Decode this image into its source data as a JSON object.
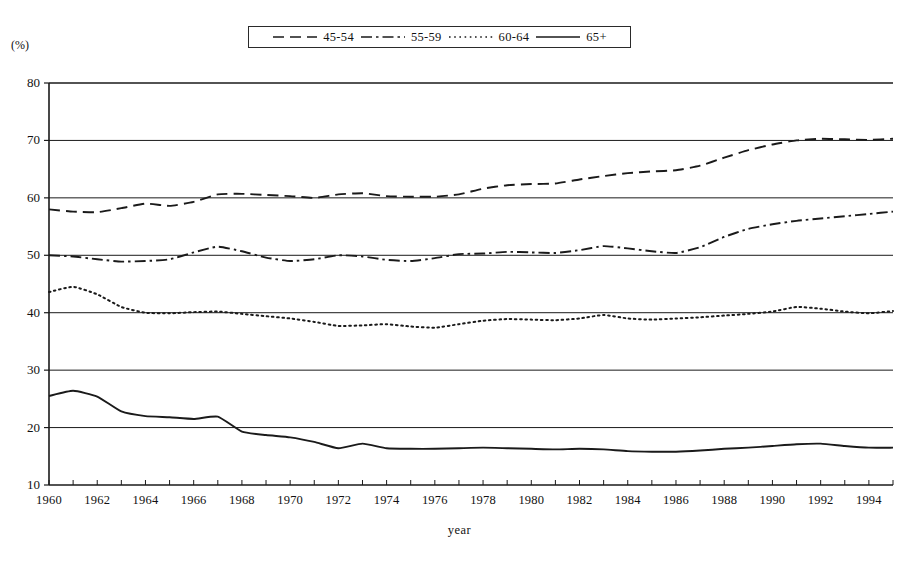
{
  "chart_data": {
    "type": "line",
    "title": "",
    "xlabel": "year",
    "ylabel": "(%)",
    "ylim": [
      10,
      80
    ],
    "xlim": [
      1960,
      1995
    ],
    "yticks": [
      80,
      70,
      60,
      50,
      40,
      30,
      20,
      10
    ],
    "xticks": [
      1960,
      1962,
      1964,
      1966,
      1968,
      1970,
      1972,
      1974,
      1976,
      1978,
      1980,
      1982,
      1984,
      1986,
      1988,
      1990,
      1992,
      1994
    ],
    "x": [
      1960,
      1961,
      1962,
      1963,
      1964,
      1965,
      1966,
      1967,
      1968,
      1969,
      1970,
      1971,
      1972,
      1973,
      1974,
      1975,
      1976,
      1977,
      1978,
      1979,
      1980,
      1981,
      1982,
      1983,
      1984,
      1985,
      1986,
      1987,
      1988,
      1989,
      1990,
      1991,
      1992,
      1993,
      1994,
      1995
    ],
    "grid": true,
    "legend_position": "top-center",
    "series": [
      {
        "name": "45-54",
        "dash": "dashed",
        "color": "#1a1a1a",
        "values": [
          58.0,
          57.6,
          57.5,
          58.2,
          59.0,
          58.6,
          59.3,
          60.6,
          60.7,
          60.5,
          60.3,
          60.0,
          60.6,
          60.8,
          60.3,
          60.2,
          60.2,
          60.6,
          61.6,
          62.2,
          62.4,
          62.5,
          63.2,
          63.8,
          64.3,
          64.6,
          64.8,
          65.6,
          67.0,
          68.3,
          69.3,
          70.0,
          70.3,
          70.2,
          70.1,
          70.3
        ]
      },
      {
        "name": "55-59",
        "dash": "dashdot",
        "color": "#1a1a1a",
        "values": [
          50.0,
          49.8,
          49.3,
          48.9,
          49.0,
          49.3,
          50.5,
          51.5,
          50.7,
          49.6,
          49.0,
          49.3,
          50.0,
          49.8,
          49.2,
          49.0,
          49.5,
          50.2,
          50.3,
          50.6,
          50.5,
          50.4,
          50.9,
          51.6,
          51.2,
          50.7,
          50.4,
          51.4,
          53.2,
          54.6,
          55.4,
          56.0,
          56.4,
          56.8,
          57.2,
          57.6
        ]
      },
      {
        "name": "60-64",
        "dash": "dotted",
        "color": "#1a1a1a",
        "values": [
          43.6,
          44.5,
          43.2,
          41.0,
          40.0,
          39.9,
          40.1,
          40.2,
          39.8,
          39.4,
          39.0,
          38.4,
          37.7,
          37.8,
          38.0,
          37.6,
          37.4,
          38.0,
          38.6,
          38.9,
          38.8,
          38.7,
          39.0,
          39.6,
          39.0,
          38.8,
          39.0,
          39.2,
          39.5,
          39.8,
          40.2,
          41.0,
          40.7,
          40.2,
          39.9,
          40.3
        ]
      },
      {
        "name": "65+",
        "dash": "solid",
        "color": "#1a1a1a",
        "values": [
          25.5,
          26.4,
          25.4,
          22.8,
          22.0,
          21.8,
          21.5,
          21.9,
          19.3,
          18.7,
          18.3,
          17.5,
          16.4,
          17.2,
          16.4,
          16.3,
          16.3,
          16.4,
          16.5,
          16.4,
          16.3,
          16.2,
          16.3,
          16.2,
          15.9,
          15.8,
          15.8,
          16.0,
          16.3,
          16.5,
          16.8,
          17.1,
          17.2,
          16.8,
          16.5,
          16.5
        ]
      }
    ]
  },
  "legend": {
    "entries": [
      {
        "label": "45-54",
        "style": "dashed"
      },
      {
        "label": "55-59",
        "style": "dashdot"
      },
      {
        "label": "60-64",
        "style": "dotted"
      },
      {
        "label": "65+",
        "style": "solid"
      }
    ]
  },
  "axes": {
    "y_unit_label": "(%)",
    "x_title": "year"
  }
}
